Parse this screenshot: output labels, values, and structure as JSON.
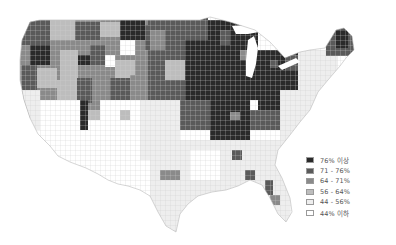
{
  "map": {
    "type": "choropleth",
    "region": "United States (counties)",
    "colors": {
      "background": "#ffffff",
      "border": "#c8c8c8"
    }
  },
  "legend": {
    "items": [
      {
        "label": "76% 이상",
        "color": "#2a2a2a"
      },
      {
        "label": "71 - 76%",
        "color": "#5a5a5a"
      },
      {
        "label": "64 - 71%",
        "color": "#8a8a8a"
      },
      {
        "label": "56 - 64%",
        "color": "#bdbdbd"
      },
      {
        "label": "44 - 56%",
        "color": "#eeeeee"
      },
      {
        "label": "44% 이하",
        "color": "#ffffff"
      }
    ]
  }
}
